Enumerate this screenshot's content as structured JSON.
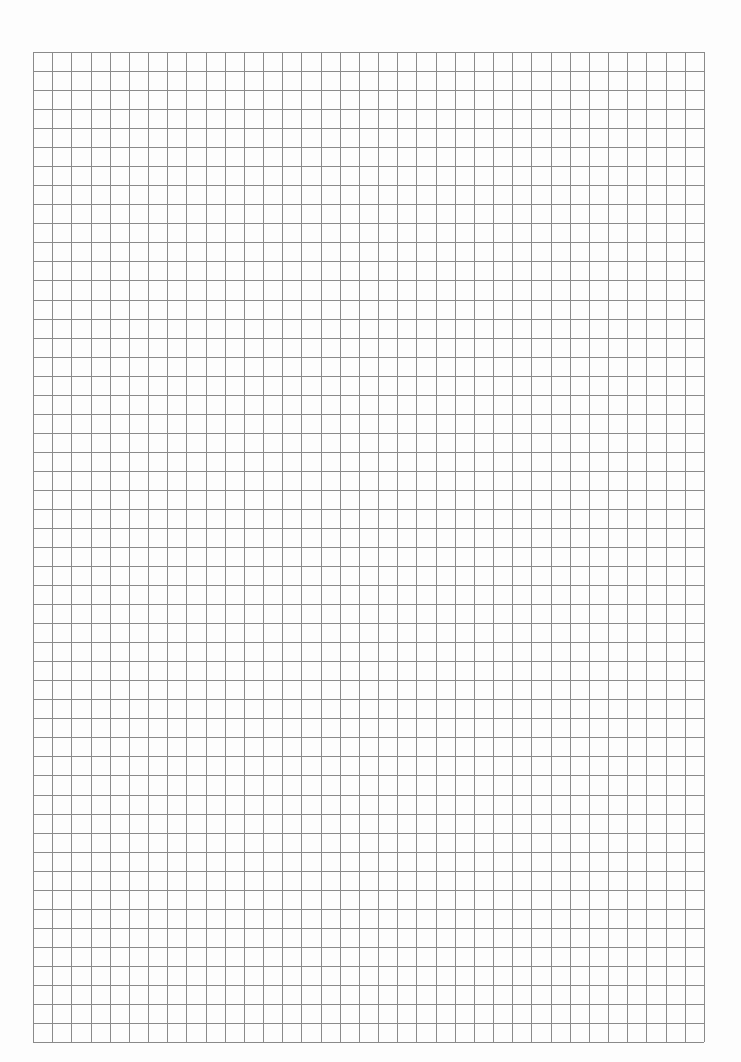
{
  "page": {
    "type": "graph-paper",
    "background": "#fdfdfd",
    "line_color": "#8a8a8a"
  },
  "grid": {
    "left": 33,
    "top": 52,
    "right": 704,
    "bottom": 1042,
    "columns": 35,
    "rows": 52
  }
}
